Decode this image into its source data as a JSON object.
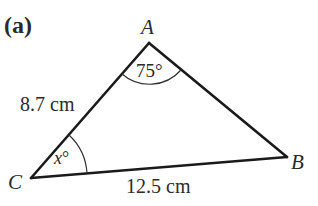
{
  "figure": {
    "part_label": "(a)",
    "vertices": {
      "A": {
        "label": "A",
        "x": 149,
        "y": 43
      },
      "B": {
        "label": "B",
        "x": 287,
        "y": 157
      },
      "C": {
        "label": "C",
        "x": 31,
        "y": 178
      }
    },
    "sides": {
      "CA": {
        "label": "8.7 cm",
        "length": 8.7,
        "unit": "cm"
      },
      "CB": {
        "label": "12.5 cm",
        "length": 12.5,
        "unit": "cm"
      }
    },
    "angles": {
      "A": {
        "label": "75°",
        "value": 75,
        "unit": "degrees"
      },
      "C": {
        "variable": "x",
        "degree_symbol": "°",
        "label": "x°"
      }
    },
    "colors": {
      "line": "#1a1a1a",
      "text": "#2a2a2a",
      "background": "#ffffff"
    }
  }
}
